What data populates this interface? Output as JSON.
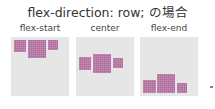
{
  "title": "flex-direction: row; の場合",
  "panels": [
    {
      "label": "flex-start"
    },
    {
      "label": "center"
    },
    {
      "label": "flex-end"
    }
  ],
  "colors": {
    "box": "#b06a9c",
    "panel": "#e6e6e6"
  }
}
